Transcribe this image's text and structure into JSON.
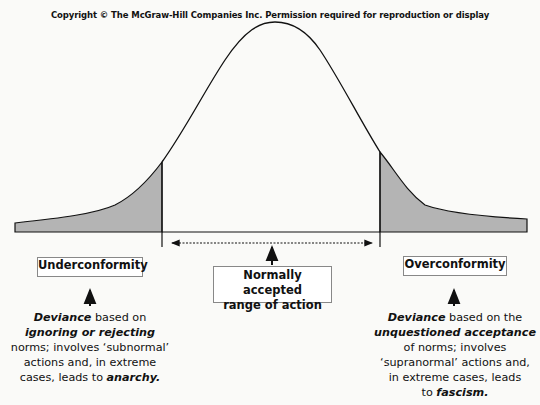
{
  "copyright": "Copyright © The McGraw-Hill Companies Inc. Permission required for reproduction or display",
  "diagram": {
    "type": "normal-distribution-curve",
    "colors": {
      "shaded_tail": "#b4b4b4",
      "line": "#111111",
      "box_border": "#888888"
    },
    "left_box": {
      "label": "Underconformity"
    },
    "center_box": {
      "line1": "Normally accepted",
      "line2": "range of action"
    },
    "right_box": {
      "label": "Overconformity"
    },
    "left_desc": {
      "l1_bold": "Deviance",
      "l1_rest": " based on",
      "l2_bold": "ignoring or rejecting",
      "l3": "norms; involves ‘subnormal’",
      "l4": "actions and, in extreme",
      "l5_pre": "cases, leads to ",
      "l5_bold": "anarchy."
    },
    "right_desc": {
      "l1_bold": "Deviance",
      "l1_rest": " based on the",
      "l2_bold": "unquestioned acceptance",
      "l3": "of norms; involves",
      "l4": "‘supranormal’ actions and,",
      "l5": "in extreme cases, leads",
      "l6_pre": "to ",
      "l6_bold": "fascism."
    }
  }
}
